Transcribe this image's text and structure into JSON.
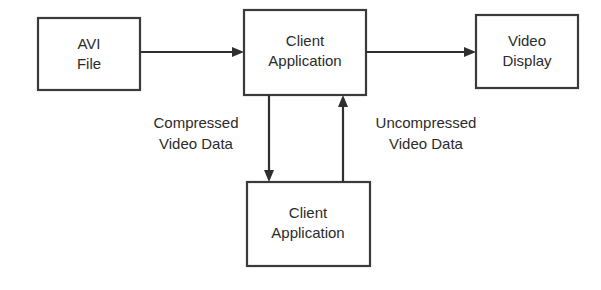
{
  "diagram": {
    "type": "flow-diagram",
    "background_color": "#ffffff",
    "stroke_color": "#2f2f2f",
    "text_color": "#2b2b2b",
    "nodes": [
      {
        "id": "avi-file",
        "line1": "AVI",
        "line2": "File"
      },
      {
        "id": "client-application-top",
        "line1": "Client",
        "line2": "Application"
      },
      {
        "id": "video-display",
        "line1": "Video",
        "line2": "Display"
      },
      {
        "id": "client-application-bottom",
        "line1": "Client",
        "line2": "Application"
      }
    ],
    "edge_labels": [
      {
        "id": "compressed-video-data",
        "line1": "Compressed",
        "line2": "Video Data"
      },
      {
        "id": "uncompressed-video-data",
        "line1": "Uncompressed",
        "line2": "Video Data"
      }
    ]
  }
}
